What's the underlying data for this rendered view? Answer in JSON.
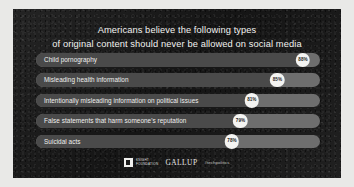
{
  "headline": {
    "line1": "Americans believe the following types",
    "line2": "of original content should never be allowed on social media"
  },
  "colors": {
    "panel_background": "#191919",
    "frame_background": "#e9e9e7",
    "track": "#6e6e6e",
    "fill": "#4a4a4a",
    "badge_background": "#f4f4f2",
    "badge_text": "#1d1d1d",
    "text": "#f2f2f0"
  },
  "chart_data": {
    "type": "bar",
    "title": "Americans believe the following types of original content should never be allowed on social media",
    "xlabel": "",
    "ylabel": "",
    "xlim": [
      0,
      100
    ],
    "grid": false,
    "legend": "none",
    "orientation": "horizontal",
    "value_suffix": "%",
    "categories": [
      "Child pornography",
      "Misleading health information",
      "Intentionally misleading information on political issues",
      "False statements that harm someone's reputation",
      "Suicidal acts"
    ],
    "values": [
      88,
      85,
      81,
      79,
      78
    ],
    "value_labels": [
      "88%",
      "85%",
      "81%",
      "79%",
      "78%"
    ]
  },
  "bars": [
    {
      "label": "Child pornography",
      "value_label": "88%",
      "fill_percent": 94
    },
    {
      "label": "Misleading health information",
      "value_label": "85%",
      "fill_percent": 85
    },
    {
      "label": "Intentionally misleading information on political issues",
      "value_label": "81%",
      "fill_percent": 76
    },
    {
      "label": "False statements that harm someone's reputation",
      "value_label": "79%",
      "fill_percent": 72
    },
    {
      "label": "Suicidal acts",
      "value_label": "78%",
      "fill_percent": 69
    }
  ],
  "footer": {
    "knight_line1": "KNIGHT",
    "knight_line2": "FOUNDATION",
    "gallup": "GALLUP",
    "hashtag": "#techpolitics"
  }
}
